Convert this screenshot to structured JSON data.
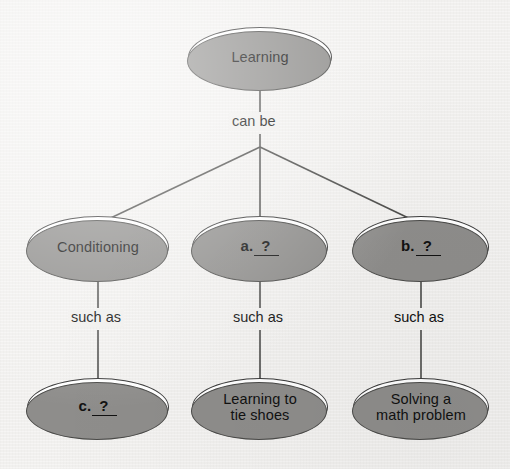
{
  "diagram": {
    "type": "concept-map",
    "background_color": "#f1f0ee",
    "node_fill_color": "#ffffff",
    "node_border_color": "#3a3a3a",
    "node_shadow_color": "#8e8d8b",
    "connector_color": "#4a4a48",
    "nodes": [
      {
        "id": "root",
        "label": "Learning",
        "kind": "text"
      },
      {
        "id": "conditioning",
        "label": "Conditioning",
        "kind": "text"
      },
      {
        "id": "blank_a",
        "prefix": "a.",
        "mark": "?",
        "kind": "blank"
      },
      {
        "id": "blank_b",
        "prefix": "b.",
        "mark": "?",
        "kind": "blank"
      },
      {
        "id": "blank_c",
        "prefix": "c.",
        "mark": "?",
        "kind": "blank"
      },
      {
        "id": "tie_shoes",
        "label": "Learning to\ntie shoes",
        "kind": "text"
      },
      {
        "id": "math",
        "label": "Solving a\nmath problem",
        "kind": "text"
      }
    ],
    "edge_labels": {
      "can_be": "can be",
      "such_as_left": "such as",
      "such_as_middle": "such as",
      "such_as_right": "such as"
    }
  }
}
